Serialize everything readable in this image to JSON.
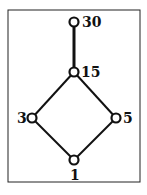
{
  "diagram": {
    "type": "hasse",
    "nodes": [
      {
        "id": "30",
        "label": "30",
        "x": 74,
        "y": 22
      },
      {
        "id": "15",
        "label": "15",
        "x": 74,
        "y": 72
      },
      {
        "id": "3",
        "label": "3",
        "x": 32,
        "y": 118
      },
      {
        "id": "5",
        "label": "5",
        "x": 116,
        "y": 118
      },
      {
        "id": "1",
        "label": "1",
        "x": 74,
        "y": 160
      }
    ],
    "edges": [
      {
        "from": "15",
        "to": "30",
        "thick": true
      },
      {
        "from": "3",
        "to": "15"
      },
      {
        "from": "5",
        "to": "15"
      },
      {
        "from": "1",
        "to": "3"
      },
      {
        "from": "1",
        "to": "5"
      }
    ]
  }
}
